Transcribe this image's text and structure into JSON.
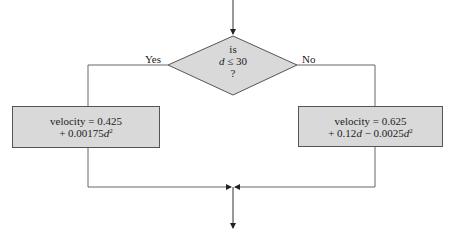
{
  "decision": {
    "line1": "is",
    "var": "d",
    "op": " ≤ 30",
    "line3": "?"
  },
  "branches": {
    "yes_label": "Yes",
    "no_label": "No"
  },
  "left_box": {
    "line1": "velocity = 0.425",
    "line2_prefix": "+ 0.00175",
    "line2_var": "d",
    "line2_exp": "2"
  },
  "right_box": {
    "line1": "velocity = 0.625",
    "line2_a": "+ 0.12",
    "line2_var1": "d",
    "line2_b": " − 0.0025",
    "line2_var2": "d",
    "line2_exp": "2"
  },
  "colors": {
    "shape_fill": "#d9d9d9",
    "line": "#555555"
  }
}
